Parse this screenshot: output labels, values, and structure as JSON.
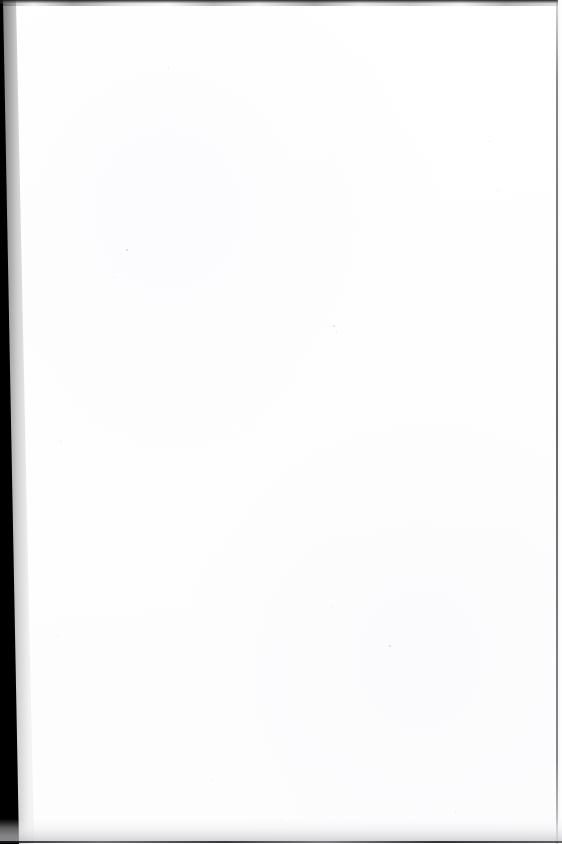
{
  "document": {
    "page_type": "blank-scanned-page",
    "has_text": false,
    "has_figures": false,
    "page_number": "",
    "header_text": "",
    "footer_text": "",
    "body_text": ""
  },
  "canvas": {
    "width": 562,
    "height": 844,
    "background_color": "#ffffff",
    "paper_color": "#fefeff"
  },
  "scan_artifacts": {
    "gutter": {
      "name": "left-binding-gutter",
      "color": "#000000",
      "edge": "left",
      "width_top_px": 3,
      "width_bottom_px": 19,
      "skew_degrees": 1.2
    },
    "top_edge": {
      "name": "top-scan-edge",
      "color": "#1c1c1e",
      "height_px": 4
    },
    "right_edge": {
      "name": "right-page-edge",
      "color": "#3a3a40",
      "x_px": 556,
      "width_px": 1.5
    },
    "bottom_edge": {
      "name": "bottom-scan-edge",
      "color": "#18181a",
      "band_height_px": 22,
      "line_height_px": 2
    }
  },
  "speckles": [
    {
      "x": 126,
      "y": 249,
      "size": 1.6
    },
    {
      "x": 114,
      "y": 277,
      "size": 1.2
    },
    {
      "x": 333,
      "y": 325,
      "size": 1.8
    },
    {
      "x": 336,
      "y": 331,
      "size": 1.3
    },
    {
      "x": 489,
      "y": 141,
      "size": 1.1
    },
    {
      "x": 497,
      "y": 190,
      "size": 1.4
    },
    {
      "x": 331,
      "y": 606,
      "size": 1.2
    },
    {
      "x": 389,
      "y": 645,
      "size": 1.5
    },
    {
      "x": 57,
      "y": 636,
      "size": 1.1
    },
    {
      "x": 212,
      "y": 780,
      "size": 1.3
    },
    {
      "x": 455,
      "y": 812,
      "size": 1.2
    },
    {
      "x": 281,
      "y": 820,
      "size": 1.4
    },
    {
      "x": 60,
      "y": 441,
      "size": 1.0
    },
    {
      "x": 168,
      "y": 68,
      "size": 1.2
    }
  ]
}
